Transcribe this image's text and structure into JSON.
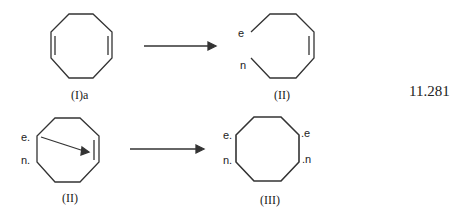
{
  "diagram": {
    "equation_number": "11.281",
    "row1": {
      "left_label": "(I)a",
      "right_label": "(II)",
      "right_marks": [
        "e",
        "n"
      ]
    },
    "row2": {
      "left_label": "(II)",
      "left_marks": [
        "e.",
        "n."
      ],
      "right_label": "(III)",
      "right_marks_left": [
        "e.",
        "n."
      ],
      "right_marks_right": [
        ".e",
        ".n"
      ]
    }
  }
}
